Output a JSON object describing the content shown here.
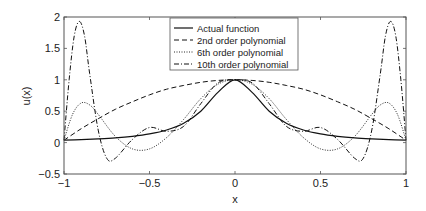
{
  "chart_data": {
    "type": "line",
    "title": "",
    "xlabel": "x",
    "ylabel": "u(x)",
    "xlim": [
      -1,
      1
    ],
    "ylim": [
      -0.5,
      2
    ],
    "xticks": [
      -1,
      -0.5,
      0,
      0.5,
      1
    ],
    "xtick_labels": [
      "−1",
      "−0.5",
      "0",
      "0.5",
      "1"
    ],
    "yticks": [
      -0.5,
      0,
      0.5,
      1,
      1.5,
      2
    ],
    "ytick_labels": [
      "−0.5",
      "0",
      "0.5",
      "1",
      "1.5",
      "2"
    ],
    "grid": false,
    "legend_position": "upper center",
    "series": [
      {
        "name": "Actual function",
        "style": "solid",
        "x": [
          -1,
          -0.9,
          -0.8,
          -0.7,
          -0.6,
          -0.5,
          -0.4,
          -0.3,
          -0.2,
          -0.1,
          0,
          0.1,
          0.2,
          0.3,
          0.4,
          0.5,
          0.6,
          0.7,
          0.8,
          0.9,
          1
        ],
        "y": [
          0.038,
          0.047,
          0.059,
          0.075,
          0.1,
          0.138,
          0.2,
          0.308,
          0.5,
          0.8,
          1.0,
          0.8,
          0.5,
          0.308,
          0.2,
          0.138,
          0.1,
          0.075,
          0.059,
          0.047,
          0.038
        ]
      },
      {
        "name": "2nd order polynomial",
        "style": "dashed",
        "x": [
          -1,
          -0.9,
          -0.8,
          -0.7,
          -0.6,
          -0.5,
          -0.4,
          -0.3,
          -0.2,
          -0.1,
          0,
          0.1,
          0.2,
          0.3,
          0.4,
          0.5,
          0.6,
          0.7,
          0.8,
          0.9,
          1
        ],
        "y": [
          0.038,
          0.22,
          0.38,
          0.53,
          0.65,
          0.76,
          0.85,
          0.91,
          0.96,
          0.99,
          1.0,
          0.99,
          0.96,
          0.91,
          0.85,
          0.76,
          0.65,
          0.53,
          0.38,
          0.22,
          0.038
        ]
      },
      {
        "name": "6th order polynomial",
        "style": "dotted",
        "x": [
          -1,
          -0.95,
          -0.9,
          -0.85,
          -0.8,
          -0.7,
          -0.6,
          -0.5,
          -0.4,
          -0.3,
          -0.2,
          -0.1,
          0,
          0.1,
          0.2,
          0.3,
          0.4,
          0.5,
          0.6,
          0.7,
          0.8,
          0.85,
          0.9,
          0.95,
          1
        ],
        "y": [
          0.038,
          0.45,
          0.63,
          0.6,
          0.45,
          0.1,
          -0.1,
          -0.1,
          0.08,
          0.37,
          0.7,
          0.93,
          1.0,
          0.93,
          0.7,
          0.37,
          0.08,
          -0.1,
          -0.1,
          0.1,
          0.45,
          0.6,
          0.63,
          0.45,
          0.038
        ]
      },
      {
        "name": "10th order polynomial",
        "style": "dashdot",
        "x": [
          -1,
          -0.97,
          -0.94,
          -0.91,
          -0.88,
          -0.85,
          -0.8,
          -0.75,
          -0.7,
          -0.6,
          -0.5,
          -0.4,
          -0.3,
          -0.2,
          -0.1,
          0,
          0.1,
          0.2,
          0.3,
          0.4,
          0.5,
          0.6,
          0.7,
          0.75,
          0.8,
          0.85,
          0.88,
          0.91,
          0.94,
          0.97,
          1
        ],
        "y": [
          0.038,
          1.0,
          1.7,
          1.93,
          1.7,
          1.1,
          0.2,
          -0.25,
          -0.25,
          0.05,
          0.24,
          0.18,
          0.26,
          0.62,
          0.95,
          1.0,
          0.95,
          0.62,
          0.26,
          0.18,
          0.24,
          0.05,
          -0.25,
          -0.25,
          0.2,
          1.1,
          1.7,
          1.93,
          1.7,
          1.0,
          0.038
        ]
      }
    ]
  },
  "legend": {
    "items": [
      {
        "label": "Actual function",
        "dash": ""
      },
      {
        "label": "2nd order polynomial",
        "dash": "5,3"
      },
      {
        "label": "6th order polynomial",
        "dash": "1,1.5"
      },
      {
        "label": "10th order polynomial",
        "dash": "5,2,1,2"
      }
    ]
  }
}
